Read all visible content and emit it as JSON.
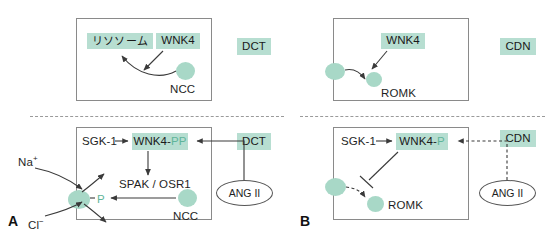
{
  "figure": {
    "panels": [
      {
        "letter": "A",
        "description": "DCT: WNK4 effects on NCC"
      },
      {
        "letter": "B",
        "description": "CDN: WNK4 effects on ROMK"
      }
    ]
  },
  "colors": {
    "highlight_bg": "#b7ded1",
    "blob": "#a8d8c7",
    "teal_text": "#5fb59a",
    "box_border": "#8a8a8a",
    "divider": "#9a9a9a",
    "text": "#1f1f1f"
  },
  "panel_a_top": {
    "segment_badge": "DCT",
    "lysosome_label": "リソソーム",
    "wnk4_label": "WNK4",
    "channel_label": "NCC"
  },
  "panel_b_top": {
    "segment_badge": "CDN",
    "wnk4_label": "WNK4",
    "channel_label": "ROMK"
  },
  "panel_a_bottom": {
    "panel_letter": "A",
    "segment_badge": "DCT",
    "sgk1_label": "SGK-1",
    "wnk4_label": "WNK4-",
    "wnk4_phos": "PP",
    "spak_osr1_label": "SPAK / OSR1",
    "channel_label": "NCC",
    "phospho_label": "P",
    "ion_sodium": "Na",
    "ion_sodium_charge": "+",
    "ion_chloride": "Cl",
    "ion_chloride_charge": "−",
    "hormone_label": "ANG II"
  },
  "panel_b_bottom": {
    "panel_letter": "B",
    "segment_badge": "CDN",
    "sgk1_label": "SGK-1",
    "wnk4_label": "WNK4-",
    "wnk4_phos": "P",
    "channel_label": "ROMK",
    "hormone_label": "ANG II"
  }
}
